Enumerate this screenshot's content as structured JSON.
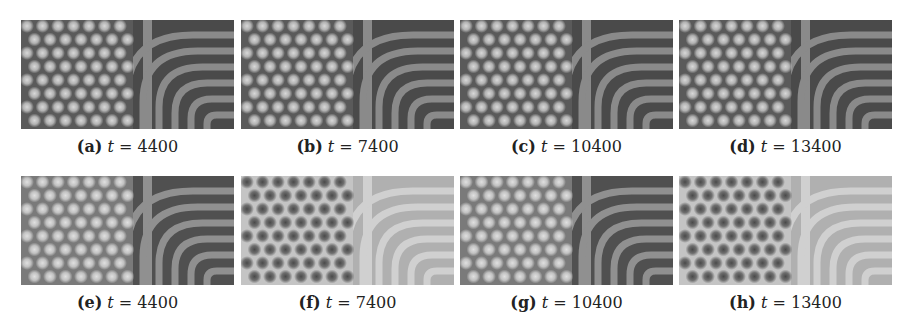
{
  "figure": {
    "panels": [
      {
        "label": "(a)",
        "var": "t",
        "eq": "=",
        "value": "4400",
        "tone": "dark-bg-bright-spots"
      },
      {
        "label": "(b)",
        "var": "t",
        "eq": "=",
        "value": "7400",
        "tone": "dark-bg-bright-spots"
      },
      {
        "label": "(c)",
        "var": "t",
        "eq": "=",
        "value": "10400",
        "tone": "dark-bg-bright-spots"
      },
      {
        "label": "(d)",
        "var": "t",
        "eq": "=",
        "value": "13400",
        "tone": "dark-bg-bright-spots"
      },
      {
        "label": "(e)",
        "var": "t",
        "eq": "=",
        "value": "4400",
        "tone": "mid-bg-bright-spots"
      },
      {
        "label": "(f)",
        "var": "t",
        "eq": "=",
        "value": "7400",
        "tone": "light-bg-dark-spots"
      },
      {
        "label": "(g)",
        "var": "t",
        "eq": "=",
        "value": "10400",
        "tone": "mid-bg-bright-spots"
      },
      {
        "label": "(h)",
        "var": "t",
        "eq": "=",
        "value": "13400",
        "tone": "light-bg-dark-spots"
      }
    ]
  }
}
